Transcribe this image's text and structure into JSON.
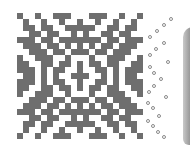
{
  "pattern": {
    "cell_size_px": 6,
    "columns": 21,
    "rows": 21,
    "fill_color": "#6e6e6e",
    "background_color": "#ffffff",
    "quadrant_rows": [
      "#..#..###..",
      ".#..#..#..#",
      ".##.##..###",
      "..##.##..#.",
      "###.##.####",
      ".###.##.#.#",
      "..###.##.##",
      "#..###..#..",
      "##..##.##.#",
      "###.#.##..#",
      ".##.#.#..##"
    ]
  },
  "rings": {
    "color": "#8a8a8a",
    "positions": [
      [
        171,
        19
      ],
      [
        164,
        25
      ],
      [
        157,
        31
      ],
      [
        150,
        37
      ],
      [
        164,
        43
      ],
      [
        156,
        49
      ],
      [
        150,
        55
      ],
      [
        168,
        62
      ],
      [
        150,
        67
      ],
      [
        154,
        73
      ],
      [
        161,
        79
      ],
      [
        154,
        86
      ],
      [
        149,
        92
      ],
      [
        166,
        97
      ],
      [
        148,
        103
      ],
      [
        153,
        108
      ],
      [
        159,
        116
      ],
      [
        148,
        121
      ],
      [
        153,
        126
      ],
      [
        158,
        132
      ],
      [
        164,
        137
      ]
    ]
  },
  "side_panel": {
    "color": "#8e8e8e"
  }
}
